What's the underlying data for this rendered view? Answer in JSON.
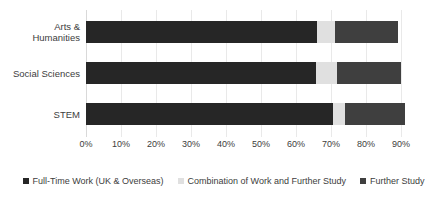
{
  "chart_data": {
    "type": "bar",
    "orientation": "horizontal",
    "stacked": true,
    "title": "",
    "xlabel": "",
    "ylabel": "",
    "categories": [
      "Arts &\nHumanities",
      "Social Sciences",
      "STEM"
    ],
    "xticks": [
      "0%",
      "10%",
      "20%",
      "30%",
      "40%",
      "50%",
      "60%",
      "70%",
      "80%",
      "90%"
    ],
    "xtick_values": [
      0,
      10,
      20,
      30,
      40,
      50,
      60,
      70,
      80,
      90
    ],
    "xlim": [
      0,
      90
    ],
    "grid": true,
    "legend_position": "bottom",
    "series": [
      {
        "name": "Full-Time Work (UK & Overseas)",
        "color": "#262626",
        "values": [
          66.0,
          65.7,
          70.6
        ]
      },
      {
        "name": "Combination of Work and Further Study",
        "color": "#e0e0e0",
        "values": [
          5.0,
          6.0,
          3.4
        ]
      },
      {
        "name": "Further Study",
        "color": "#3f3f3f",
        "values": [
          18.0,
          18.3,
          17.0
        ]
      }
    ],
    "totals": [
      89.0,
      90.0,
      91.0
    ]
  },
  "colors": {
    "gridline": "#e9e9e9",
    "axis": "#d9d9d9",
    "text": "#3d3d3d",
    "background": "#ffffff"
  }
}
